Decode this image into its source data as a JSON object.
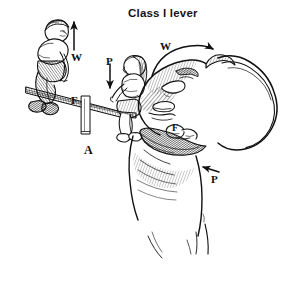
{
  "figure": {
    "title": "Class I lever",
    "background_color": "#ffffff",
    "ink_color": "#101010",
    "style": "black-and-white pen-and-ink line drawing with cross-hatch shading",
    "panels": [
      {
        "id": "A",
        "panel_label": "A",
        "subject": "two children on a seesaw demonstrating a first-class lever",
        "labels": [
          {
            "text": "W",
            "meaning": "weight",
            "arrow": "straight-up"
          },
          {
            "text": "P",
            "meaning": "effort / pull",
            "arrow": "straight-down"
          },
          {
            "text": "F",
            "meaning": "fulcrum",
            "arrow": "none"
          }
        ]
      },
      {
        "id": "B",
        "panel_label": "",
        "subject": "human head tilted back on the neck demonstrating a first-class lever",
        "labels": [
          {
            "text": "W",
            "meaning": "weight of the head",
            "arrow": "curved-right"
          },
          {
            "text": "F",
            "meaning": "fulcrum at the atlanto-occipital joint",
            "arrow": "none"
          },
          {
            "text": "P",
            "meaning": "pull of the posterior neck muscles",
            "arrow": "short-left"
          }
        ]
      }
    ]
  },
  "labels": {
    "w_left": "W",
    "p_left": "P",
    "f_left": "F",
    "panel_a": "A",
    "w_right": "W",
    "f_right": "F",
    "p_right": "P"
  }
}
